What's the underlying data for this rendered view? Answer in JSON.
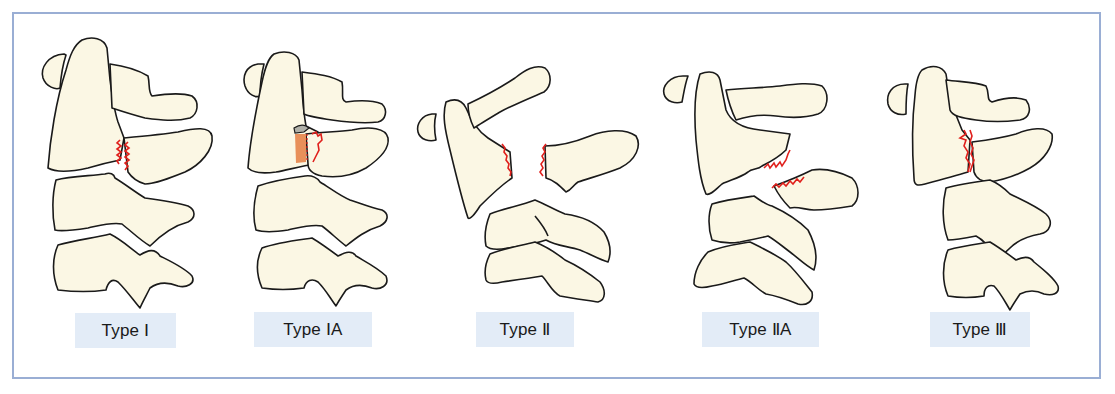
{
  "figure": {
    "panels": [
      {
        "id": "type-1",
        "label": "Type Ⅰ"
      },
      {
        "id": "type-1a",
        "label": "Type ⅠA"
      },
      {
        "id": "type-2",
        "label": "Type Ⅱ"
      },
      {
        "id": "type-2a",
        "label": "Type ⅡA"
      },
      {
        "id": "type-3",
        "label": "Type Ⅲ"
      }
    ],
    "colors": {
      "frame_border": "#9aaed4",
      "bone_fill": "#fbf7e4",
      "bone_outline": "#1a1a1a",
      "fracture_line": "#e0201c",
      "fragment_highlight": "#e8905a",
      "label_background": "#e3ecf7"
    }
  }
}
